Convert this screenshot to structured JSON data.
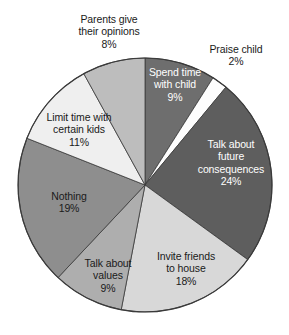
{
  "chart_data": {
    "type": "pie",
    "title": "",
    "subtitle": "",
    "xlabel": "",
    "ylabel": "",
    "units": "percent",
    "total": 100,
    "start_angle_deg": 0,
    "direction": "clockwise",
    "legend": "none",
    "grid": false,
    "categories": [
      "Spend time with child",
      "Praise child",
      "Talk about future consequences",
      "Invite friends to house",
      "Talk about values",
      "Nothing",
      "Limit time with certain kids",
      "Parents give their opinions"
    ],
    "values": [
      9,
      2,
      24,
      18,
      9,
      19,
      11,
      8
    ],
    "value_labels": [
      "9%",
      "2%",
      "24%",
      "18%",
      "9%",
      "19%",
      "11%",
      "8%"
    ],
    "colors": [
      "#6e6e6e",
      "#fdfdfd",
      "#5e5e5e",
      "#d8d8d8",
      "#aeaeae",
      "#8e8e8e",
      "#efefef",
      "#bdbdbd"
    ],
    "slices": [
      {
        "label": "Spend time with child",
        "value": 9,
        "value_label": "9%",
        "color": "#6e6e6e",
        "text_color": "#ffffff",
        "label_placement": "inside",
        "lines": [
          "Spend time",
          "with child",
          "9%"
        ]
      },
      {
        "label": "Praise child",
        "value": 2,
        "value_label": "2%",
        "color": "#fdfdfd",
        "text_color": "#1a1a1a",
        "label_placement": "outside",
        "lines": [
          "Praise child",
          "2%"
        ]
      },
      {
        "label": "Talk about future consequences",
        "value": 24,
        "value_label": "24%",
        "color": "#5e5e5e",
        "text_color": "#ffffff",
        "label_placement": "inside",
        "lines": [
          "Talk about",
          "future",
          "consequences",
          "24%"
        ]
      },
      {
        "label": "Invite friends to house",
        "value": 18,
        "value_label": "18%",
        "color": "#d8d8d8",
        "text_color": "#1a1a1a",
        "label_placement": "inside",
        "lines": [
          "Invite friends",
          "to house",
          "18%"
        ]
      },
      {
        "label": "Talk about values",
        "value": 9,
        "value_label": "9%",
        "color": "#aeaeae",
        "text_color": "#1a1a1a",
        "label_placement": "inside",
        "lines": [
          "Talk about",
          "values",
          "9%"
        ]
      },
      {
        "label": "Nothing",
        "value": 19,
        "value_label": "19%",
        "color": "#8e8e8e",
        "text_color": "#1a1a1a",
        "label_placement": "inside",
        "lines": [
          "Nothing",
          "19%"
        ]
      },
      {
        "label": "Limit time with certain kids",
        "value": 11,
        "value_label": "11%",
        "color": "#efefef",
        "text_color": "#1a1a1a",
        "label_placement": "inside",
        "lines": [
          "Limit time with",
          "certain kids",
          "11%"
        ]
      },
      {
        "label": "Parents give their opinions",
        "value": 8,
        "value_label": "8%",
        "color": "#bdbdbd",
        "text_color": "#1a1a1a",
        "label_placement": "outside",
        "lines": [
          "Parents give",
          "their opinions",
          "8%"
        ]
      }
    ]
  },
  "geometry": {
    "cx": 145,
    "cy": 185,
    "r": 127,
    "stroke": "#3a3a3a",
    "stroke_width": 0.8
  },
  "labels": {
    "parents_give_opinions": {
      "l1": "Parents give",
      "l2": "their opinions",
      "l3": "8%"
    },
    "praise_child": {
      "l1": "Praise child",
      "l2": "2%"
    },
    "spend_time_with_child": {
      "l1": "Spend time",
      "l2": "with child",
      "l3": "9%"
    },
    "talk_about_future_consequences": {
      "l1": "Talk about",
      "l2": "future",
      "l3": "consequences",
      "l4": "24%"
    },
    "invite_friends_to_house": {
      "l1": "Invite friends",
      "l2": "to house",
      "l3": "18%"
    },
    "talk_about_values": {
      "l1": "Talk about",
      "l2": "values",
      "l3": "9%"
    },
    "nothing": {
      "l1": "Nothing",
      "l2": "19%"
    },
    "limit_time_certain_kids": {
      "l1": "Limit time with",
      "l2": "certain kids",
      "l3": "11%"
    }
  }
}
